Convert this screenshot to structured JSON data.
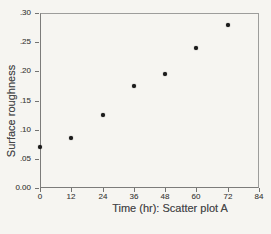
{
  "chart_data": {
    "type": "scatter",
    "title": "",
    "xlabel": "Time (hr): Scatter plot A",
    "ylabel": "Surface roughness",
    "xlim": [
      0,
      84
    ],
    "ylim": [
      0,
      0.3
    ],
    "grid": false,
    "legend": null,
    "x_ticks": [
      {
        "v": 0,
        "label": "0"
      },
      {
        "v": 12,
        "label": "12"
      },
      {
        "v": 24,
        "label": "24"
      },
      {
        "v": 36,
        "label": "36"
      },
      {
        "v": 48,
        "label": "48"
      },
      {
        "v": 60,
        "label": "60"
      },
      {
        "v": 72,
        "label": "72"
      },
      {
        "v": 84,
        "label": "84"
      }
    ],
    "y_ticks": [
      {
        "v": 0.0,
        "label": "0.00"
      },
      {
        "v": 0.05,
        "label": ".05"
      },
      {
        "v": 0.1,
        "label": ".10"
      },
      {
        "v": 0.15,
        "label": ".15"
      },
      {
        "v": 0.2,
        "label": ".20"
      },
      {
        "v": 0.25,
        "label": ".25"
      },
      {
        "v": 0.3,
        "label": ".30"
      }
    ],
    "points": [
      {
        "x": 0,
        "y": 0.07
      },
      {
        "x": 12,
        "y": 0.085
      },
      {
        "x": 24,
        "y": 0.125
      },
      {
        "x": 36,
        "y": 0.175
      },
      {
        "x": 48,
        "y": 0.195
      },
      {
        "x": 60,
        "y": 0.24
      },
      {
        "x": 72,
        "y": 0.28
      }
    ],
    "marker": {
      "shape": "dot",
      "color": "#1b1b1b",
      "size_px": 4
    }
  },
  "style": {
    "background": "#f6f5f1",
    "frame_color": "#8f8f8d",
    "tick_color": "#737371",
    "text_color": "#4b4b49",
    "point_color": "#1b1b1b"
  }
}
